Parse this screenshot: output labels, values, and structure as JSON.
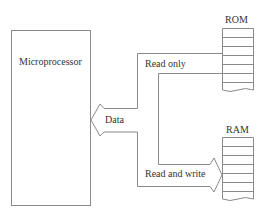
{
  "diagram": {
    "microprocessor": {
      "label": "Microprocessor"
    },
    "rom": {
      "label": "ROM",
      "rows": 7
    },
    "ram": {
      "label": "RAM",
      "rows": 7
    },
    "bus": {
      "label": "Data"
    },
    "paths": {
      "rom_path": {
        "label": "Read only"
      },
      "ram_path": {
        "label": "Read and write"
      }
    },
    "colors": {
      "stroke": "#8a8a8a",
      "text": "#333333",
      "background": "#ffffff"
    }
  }
}
